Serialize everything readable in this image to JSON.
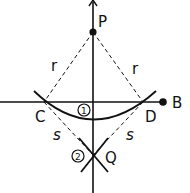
{
  "diagram": {
    "colors": {
      "ink": "#111111",
      "background": "#ffffff"
    },
    "points": {
      "P": {
        "label": "P"
      },
      "B": {
        "label": "B"
      },
      "C": {
        "label": "C"
      },
      "D": {
        "label": "D"
      },
      "Q": {
        "label": "Q"
      }
    },
    "radii": {
      "r": "r",
      "s": "s"
    },
    "steps": {
      "step1": "1",
      "step2": "2"
    }
  }
}
